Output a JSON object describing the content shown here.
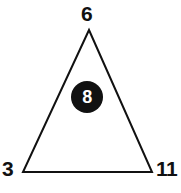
{
  "figure": {
    "type": "triangle-diagram",
    "background_color": "#ffffff",
    "stroke_color": "#111111",
    "stroke_width": 2,
    "triangle": {
      "apex": {
        "x": 89,
        "y": 30
      },
      "bottom_left": {
        "x": 23,
        "y": 172
      },
      "bottom_right": {
        "x": 152,
        "y": 172
      }
    },
    "vertex_labels": {
      "apex": "6",
      "bottom_left": "3",
      "bottom_right": "11"
    },
    "interior_token": {
      "value": "8",
      "shape": "circle",
      "fill_color": "#111111",
      "text_color": "#ffffff",
      "center": {
        "x": 87,
        "y": 97
      },
      "radius": 16
    }
  }
}
